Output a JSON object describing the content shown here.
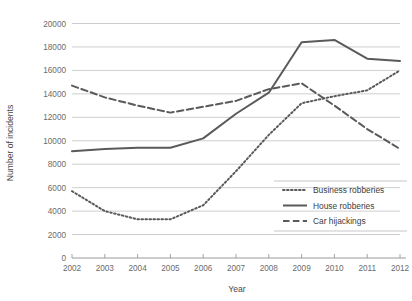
{
  "chart_data": {
    "type": "line",
    "title": "",
    "xlabel": "Year",
    "ylabel": "Number of incidents",
    "x": [
      2002,
      2003,
      2004,
      2005,
      2006,
      2007,
      2008,
      2009,
      2010,
      2011,
      2012
    ],
    "xlim": [
      2002,
      2012
    ],
    "ylim": [
      0,
      20000
    ],
    "xticks": [
      "2002",
      "2003",
      "2004",
      "2005",
      "2006",
      "2007",
      "2008",
      "2009",
      "2010",
      "2011",
      "2012"
    ],
    "yticks": [
      "0",
      "2000",
      "4000",
      "6000",
      "8000",
      "10000",
      "12000",
      "14000",
      "16000",
      "18000",
      "20000"
    ],
    "ytick_values": [
      0,
      2000,
      4000,
      6000,
      8000,
      10000,
      12000,
      14000,
      16000,
      18000,
      20000
    ],
    "grid": "horizontal",
    "legend_position": "inside-bottom-right",
    "series": [
      {
        "name": "Business robberies",
        "style": "dotted",
        "color": "#5a5a5a",
        "values": [
          5700,
          4000,
          3300,
          3300,
          4500,
          7400,
          10500,
          13200,
          13800,
          14300,
          16000
        ]
      },
      {
        "name": "House robberies",
        "style": "solid",
        "color": "#5a5a5a",
        "values": [
          9100,
          9300,
          9400,
          9400,
          10200,
          12300,
          14100,
          18400,
          18600,
          17000,
          16800
        ]
      },
      {
        "name": "Car hijackings",
        "style": "dashed",
        "color": "#5a5a5a",
        "values": [
          14700,
          13700,
          13000,
          12400,
          12900,
          13400,
          14400,
          14900,
          13000,
          11000,
          9300
        ]
      }
    ]
  },
  "legend": {
    "items": [
      {
        "label": "Business robberies",
        "style": "dotted"
      },
      {
        "label": "House robberies",
        "style": "solid"
      },
      {
        "label": "Car hijackings",
        "style": "dashed"
      }
    ]
  },
  "axes": {
    "x_title": "Year",
    "y_title": "Number of incidents"
  }
}
